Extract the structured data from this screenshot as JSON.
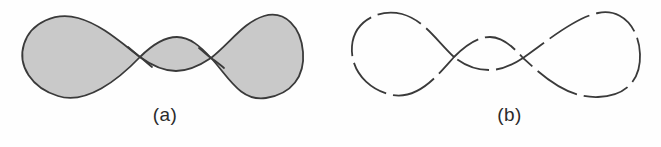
{
  "figure": {
    "background_color": "#fefefe",
    "stroke_color": "#3a3a3a",
    "fill_color": "#c9c9c9",
    "caption_color": "#2b2b2b"
  },
  "panels": [
    {
      "id": "panel-a",
      "caption": "(a)",
      "style": "solid-outline-filled",
      "fill": "#c9c9c9",
      "stroke": "#3a3a3a",
      "stroke_width": 1.8,
      "dashed": false,
      "description": "closed self-intersecting curve with two large outer lobes and one small central lobe, interior shaded gray"
    },
    {
      "id": "panel-b",
      "caption": "(b)",
      "style": "dashed-outline-unfilled",
      "fill": "none",
      "stroke": "#3a3a3a",
      "stroke_width": 1.8,
      "dashed": true,
      "dash_pattern": "46 7",
      "description": "same closed self-intersecting curve drawn as a broken dashed outline with no shading"
    }
  ],
  "geometry": {
    "panel_a": {
      "crossing_left": [
        140,
        57
      ],
      "crossing_right": [
        211,
        58
      ],
      "left_lobe_extent": [
        22,
        140
      ],
      "right_lobe_extent": [
        211,
        303
      ],
      "left_lobe_peak": [
        68,
        17
      ],
      "right_lobe_peak": [
        258,
        15
      ],
      "middle_lobe_peak": [
        176,
        37
      ],
      "middle_lobe_trough": [
        176,
        70
      ]
    },
    "panel_b": {
      "crossing_left": [
        124,
        57
      ],
      "crossing_right": [
        193,
        58
      ],
      "left_lobe_extent": [
        22,
        124
      ],
      "right_lobe_extent": [
        193,
        310
      ],
      "left_lobe_peak": [
        73,
        13
      ],
      "right_lobe_peak": [
        266,
        12
      ],
      "middle_lobe_peak": [
        160,
        37
      ],
      "middle_lobe_trough": [
        160,
        69
      ]
    }
  }
}
